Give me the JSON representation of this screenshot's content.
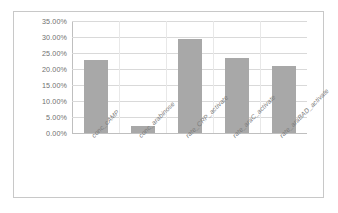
{
  "chart_data": {
    "type": "bar",
    "title": "",
    "xlabel": "",
    "ylabel": "",
    "categories": [
      "conc_cAMP",
      "conc_arabinose",
      "rate_CRP_activate",
      "rate_araC_activate",
      "rate_araBAD_activate"
    ],
    "values": [
      22.8,
      2.2,
      29.3,
      23.3,
      20.8
    ],
    "value_labels": [
      "22.80%",
      "2.20%",
      "29.30%",
      "23.30%",
      "20.80%"
    ],
    "ylim": [
      0,
      35
    ],
    "ytick_labels": [
      "0.00%",
      "5.00%",
      "10.00%",
      "15.00%",
      "20.00%",
      "25.00%",
      "30.00%",
      "35.00%"
    ],
    "ytick_values": [
      0,
      5,
      10,
      15,
      20,
      25,
      30,
      35
    ],
    "grid": true,
    "legend": false,
    "legend_position": "none",
    "bar_color": "#a8a8a8",
    "gridline_color": "#d9d9d9",
    "axis_color": "#bfbfbf",
    "plot_background": "#ffffff",
    "border_color": "#c8c8c8",
    "tick_label_color": "#6f6f6f",
    "category_label_color": "#7a7a7a",
    "category_label_rotation": -45
  }
}
